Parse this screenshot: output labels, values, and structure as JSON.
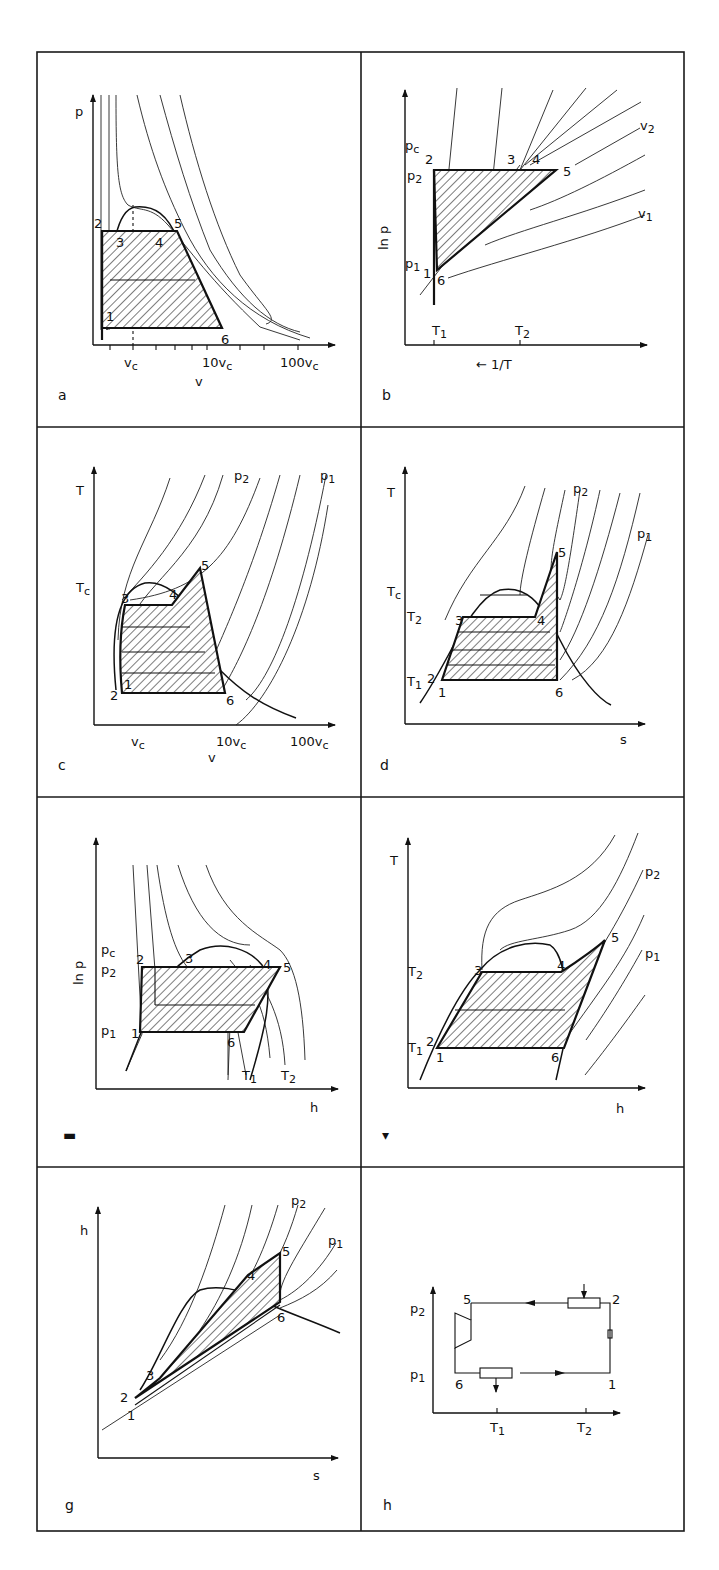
{
  "figure": {
    "panels": [
      {
        "id": "a",
        "panel_label": "a",
        "y_axis": "p",
        "x_axis": "v",
        "x_ticks": [
          "v_c",
          "10v_c",
          "100v_c"
        ],
        "x_tick_text": {
          "vc": "v",
          "vc_sub": "c",
          "ten": "10v",
          "ten_sub": "c",
          "hundred": "100v",
          "hundred_sub": "c"
        },
        "state_points": [
          "1",
          "2",
          "3",
          "4",
          "5",
          "6"
        ]
      },
      {
        "id": "b",
        "panel_label": "b",
        "y_axis": "ln p",
        "x_axis": "← 1/T",
        "y_ticks": {
          "pc": "p",
          "pc_sub": "c",
          "p2": "p",
          "p2_sub": "2",
          "p1": "p",
          "p1_sub": "1"
        },
        "x_ticks": {
          "t1": "T",
          "t1_sub": "1",
          "t2": "T",
          "t2_sub": "2"
        },
        "curve_labels": {
          "v2": "v",
          "v2_sub": "2",
          "v1": "v",
          "v1_sub": "1"
        },
        "state_points": [
          "1",
          "2",
          "3",
          "4",
          "5",
          "6"
        ]
      },
      {
        "id": "c",
        "panel_label": "c",
        "y_axis": "T",
        "x_axis": "v",
        "y_ticks": {
          "tc": "T",
          "tc_sub": "c"
        },
        "x_ticks": [
          "v_c",
          "10v_c",
          "100v_c"
        ],
        "x_tick_text": {
          "vc": "v",
          "vc_sub": "c",
          "ten": "10v",
          "ten_sub": "c",
          "hundred": "100v",
          "hundred_sub": "c"
        },
        "curve_labels": {
          "p2": "p",
          "p2_sub": "2",
          "p1": "p",
          "p1_sub": "1"
        },
        "state_points": [
          "1",
          "2",
          "3",
          "4",
          "5",
          "6"
        ]
      },
      {
        "id": "d",
        "panel_label": "d",
        "y_axis": "T",
        "x_axis": "s",
        "y_ticks": {
          "tc": "T",
          "tc_sub": "c",
          "t2": "T",
          "t2_sub": "2",
          "t1": "T",
          "t1_sub": "1"
        },
        "curve_labels": {
          "p2": "p",
          "p2_sub": "2",
          "p1": "p",
          "p1_sub": "1"
        },
        "state_points": [
          "1",
          "2",
          "3",
          "4",
          "5",
          "6"
        ]
      },
      {
        "id": "e",
        "panel_label": "e",
        "panel_label_visible": "▬",
        "y_axis": "ln p",
        "x_axis": "h",
        "y_ticks": {
          "pc": "p",
          "pc_sub": "c",
          "p2": "p",
          "p2_sub": "2",
          "p1": "p",
          "p1_sub": "1"
        },
        "curve_labels": {
          "t1": "T",
          "t1_sub": "1",
          "t2": "T",
          "t2_sub": "2"
        },
        "state_points": [
          "1",
          "2",
          "3",
          "4",
          "5",
          "6"
        ]
      },
      {
        "id": "f",
        "panel_label": "f",
        "panel_label_visible": "▾",
        "y_axis": "T",
        "x_axis": "h",
        "y_ticks": {
          "t2": "T",
          "t2_sub": "2",
          "t1": "T",
          "t1_sub": "1"
        },
        "curve_labels": {
          "p2": "p",
          "p2_sub": "2",
          "p1": "p",
          "p1_sub": "1"
        },
        "state_points": [
          "1",
          "2",
          "3",
          "4",
          "5",
          "6"
        ]
      },
      {
        "id": "g",
        "panel_label": "g",
        "y_axis": "h",
        "x_axis": "s",
        "curve_labels": {
          "p2": "p",
          "p2_sub": "2",
          "p1": "p",
          "p1_sub": "1"
        },
        "state_points": [
          "1",
          "2",
          "3",
          "4",
          "5",
          "6"
        ]
      },
      {
        "id": "h",
        "panel_label": "h",
        "y_ticks": {
          "p2": "p",
          "p2_sub": "2",
          "p1": "p",
          "p1_sub": "1"
        },
        "x_ticks": {
          "t1": "T",
          "t1_sub": "1",
          "t2": "T",
          "t2_sub": "2"
        },
        "state_points": [
          "1",
          "2",
          "5",
          "6"
        ],
        "components": [
          "heat-exchanger-high",
          "heat-exchanger-low",
          "turbine",
          "pump"
        ]
      }
    ],
    "points": {
      "p1": "1",
      "p2": "2",
      "p3": "3",
      "p4": "4",
      "p5": "5",
      "p6": "6"
    }
  }
}
